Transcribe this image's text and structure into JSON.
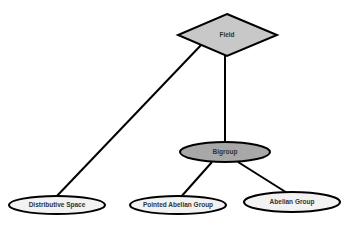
{
  "diagram": {
    "type": "er-like hierarchy",
    "nodes": [
      {
        "id": "field",
        "label": "Field",
        "shape": "diamond",
        "fill": "#c8c8c8"
      },
      {
        "id": "bigroup",
        "label": "Bigroup",
        "shape": "ellipse",
        "fill": "#a8a8a8"
      },
      {
        "id": "distributive_space",
        "label": "Distributive Space",
        "shape": "ellipse",
        "fill": "#f2f2f2"
      },
      {
        "id": "pointed_abelian_group",
        "label": "Pointed Abelian Group",
        "shape": "ellipse",
        "fill": "#f2f2f2"
      },
      {
        "id": "abelian_group",
        "label": "Abelian Group",
        "shape": "ellipse",
        "fill": "#f2f2f2"
      }
    ],
    "edges": [
      {
        "from": "field",
        "to": "distributive_space"
      },
      {
        "from": "field",
        "to": "bigroup"
      },
      {
        "from": "bigroup",
        "to": "pointed_abelian_group"
      },
      {
        "from": "bigroup",
        "to": "abelian_group"
      }
    ]
  },
  "labels": {
    "field": "Field",
    "bigroup": "Bigroup",
    "distributive_space": "Distributive Space",
    "pointed_abelian_group": "Pointed Abelian Group",
    "abelian_group": "Abelian Group"
  },
  "colors": {
    "stroke": "#000000",
    "diamond_fill": "#c8c8c8",
    "bigroup_fill": "#a8a8a8",
    "leaf_fill": "#f2f2f2",
    "text": "#333333"
  }
}
